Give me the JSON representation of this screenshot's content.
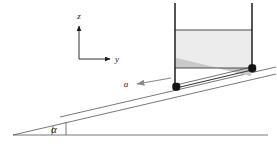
{
  "figure": {
    "type": "physics-free-body-diagram",
    "labels": {
      "z_axis": "z",
      "y_axis": "y",
      "acceleration": "a",
      "incline_angle": "α"
    },
    "colors": {
      "outline": "#1a1a1a",
      "thin_line": "#555555",
      "liquid_fill": "#ececec",
      "sediment_fill": "#c9c9c9",
      "wheel_fill": "#141414",
      "background": "#ffffff",
      "arrow": "#6e6e6e"
    },
    "geometry": {
      "incline_angle_degrees": 13,
      "ground_line_y": 135,
      "ground_line_x_start": 13,
      "ground_line_x_end": 268,
      "incline_apex_x": 13,
      "incline_apex_y": 135,
      "tank_left_wall_x": 174,
      "tank_right_wall_x": 253,
      "tank_top_y": 3,
      "liquid_surface_y": 30,
      "interface_y": 68
    },
    "elements": {
      "tank": "open-rectangular-tank",
      "liquid": "free-surface-liquid",
      "wheels": 2,
      "axes": "z-y-coordinate-frame",
      "arrow": "acceleration-vector-down-slope",
      "angle_arc": "alpha-angle-arc"
    }
  }
}
